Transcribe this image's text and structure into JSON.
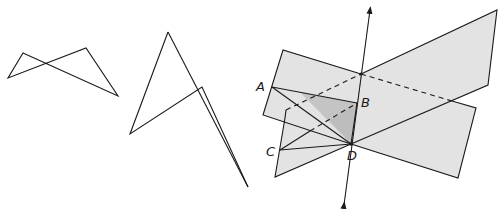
{
  "figures": [
    {
      "id": "figure-1",
      "description": "Self-intersecting quadrilateral (crossed polygon)",
      "points": [
        [
          23,
          53
        ],
        [
          118,
          96
        ],
        [
          86,
          48
        ],
        [
          8,
          78
        ]
      ]
    },
    {
      "id": "figure-2",
      "description": "Skew quadrilateral with folded vertex",
      "points": [
        [
          168,
          32
        ],
        [
          130,
          134
        ],
        [
          202,
          87
        ],
        [
          248,
          187
        ]
      ],
      "extra_line": [
        [
          168,
          32
        ],
        [
          243,
          180
        ]
      ]
    },
    {
      "id": "figure-3",
      "description": "Two intersecting planes with line of intersection and tetrahedron ABCD",
      "labels": {
        "A": "A",
        "B": "B",
        "C": "C",
        "D": "D"
      },
      "points": {
        "A": [
          272,
          87
        ],
        "B": [
          357,
          103
        ],
        "C": [
          280,
          150
        ],
        "D": [
          351,
          144
        ]
      },
      "colors": {
        "plane_fill": "#e3e3e3",
        "shaded_face": "#c4c4c4",
        "stroke": "#1a1a1a"
      }
    }
  ]
}
